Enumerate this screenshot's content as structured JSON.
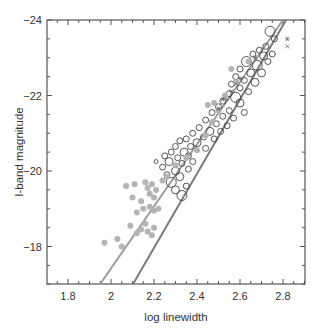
{
  "chart_data": {
    "type": "scatter",
    "title": "",
    "xlabel": "log linewidth",
    "ylabel": "I-band magnitude",
    "xlim": [
      1.7,
      2.9
    ],
    "ylim": [
      -17.0,
      -24.0
    ],
    "y_inverted": true,
    "x_ticks": [
      1.8,
      2.0,
      2.2,
      2.4,
      2.6,
      2.8
    ],
    "x_tick_labels": [
      "1.8",
      "2",
      "2.2",
      "2.4",
      "2.6",
      "2.8"
    ],
    "y_ticks": [
      -24,
      -22,
      -20,
      -18
    ],
    "y_tick_labels": [
      "-24",
      "-22",
      "-20",
      "-18"
    ],
    "grid": false,
    "legend": null,
    "lines": [
      {
        "name": "fit-left",
        "color": "#9a9a9a",
        "x": [
          1.949,
          2.8
        ],
        "y": [
          -17.0,
          -24.0
        ]
      },
      {
        "name": "fit-right",
        "color": "#7a7a7a",
        "x": [
          2.102,
          2.814
        ],
        "y": [
          -17.0,
          -24.0
        ]
      }
    ],
    "series": [
      {
        "name": "open circles",
        "marker": "open-circle",
        "color": "#444444",
        "points": [
          [
            2.74,
            -23.7,
            5
          ],
          [
            2.76,
            -23.5,
            3
          ],
          [
            2.72,
            -23.3,
            3
          ],
          [
            2.69,
            -23.2,
            3
          ],
          [
            2.66,
            -23.1,
            3
          ],
          [
            2.71,
            -23.05,
            4
          ],
          [
            2.75,
            -23.1,
            3
          ],
          [
            2.63,
            -22.9,
            5
          ],
          [
            2.68,
            -22.8,
            5
          ],
          [
            2.73,
            -22.9,
            3
          ],
          [
            2.6,
            -22.7,
            3
          ],
          [
            2.65,
            -22.6,
            4
          ],
          [
            2.7,
            -22.6,
            4
          ],
          [
            2.58,
            -22.5,
            3
          ],
          [
            2.62,
            -22.4,
            3
          ],
          [
            2.67,
            -22.35,
            4
          ],
          [
            2.56,
            -22.3,
            3
          ],
          [
            2.6,
            -22.2,
            3
          ],
          [
            2.64,
            -22.1,
            3
          ],
          [
            2.55,
            -22.05,
            3
          ],
          [
            2.58,
            -21.95,
            5
          ],
          [
            2.52,
            -21.85,
            3
          ],
          [
            2.6,
            -21.8,
            4
          ],
          [
            2.5,
            -21.7,
            3
          ],
          [
            2.55,
            -21.6,
            3
          ],
          [
            2.62,
            -21.55,
            3
          ],
          [
            2.47,
            -21.55,
            3
          ],
          [
            2.52,
            -21.45,
            3
          ],
          [
            2.57,
            -21.4,
            3
          ],
          [
            2.44,
            -21.35,
            3
          ],
          [
            2.49,
            -21.25,
            3
          ],
          [
            2.54,
            -21.2,
            3
          ],
          [
            2.41,
            -21.15,
            3
          ],
          [
            2.46,
            -21.05,
            4
          ],
          [
            2.51,
            -21.05,
            3
          ],
          [
            2.38,
            -21.0,
            3
          ],
          [
            2.43,
            -20.9,
            3
          ],
          [
            2.48,
            -20.85,
            3
          ],
          [
            2.35,
            -20.85,
            3
          ],
          [
            2.4,
            -20.75,
            4
          ],
          [
            2.32,
            -20.8,
            3
          ],
          [
            2.37,
            -20.65,
            3
          ],
          [
            2.44,
            -20.6,
            3
          ],
          [
            2.3,
            -20.65,
            3
          ],
          [
            2.34,
            -20.5,
            4
          ],
          [
            2.28,
            -20.5,
            3
          ],
          [
            2.25,
            -20.4,
            3
          ],
          [
            2.31,
            -20.35,
            3
          ],
          [
            2.36,
            -20.4,
            3
          ],
          [
            2.27,
            -20.25,
            4
          ],
          [
            2.33,
            -20.2,
            3
          ],
          [
            2.38,
            -20.25,
            3
          ],
          [
            2.24,
            -20.1,
            3
          ],
          [
            2.3,
            -20.0,
            4
          ],
          [
            2.36,
            -20.05,
            3
          ],
          [
            2.21,
            -20.25,
            2
          ],
          [
            2.26,
            -19.9,
            3
          ],
          [
            2.32,
            -19.85,
            4
          ],
          [
            2.28,
            -19.7,
            5
          ],
          [
            2.35,
            -19.6,
            3
          ],
          [
            2.3,
            -19.5,
            4
          ],
          [
            2.33,
            -19.35,
            5
          ]
        ]
      },
      {
        "name": "filled grey circles",
        "marker": "filled-circle",
        "color": "#b4b4b4",
        "points": [
          [
            1.97,
            -18.1
          ],
          [
            2.03,
            -18.2
          ],
          [
            2.05,
            -18.0
          ],
          [
            2.09,
            -18.55
          ],
          [
            2.12,
            -18.35
          ],
          [
            2.14,
            -18.45
          ],
          [
            2.17,
            -18.4
          ],
          [
            2.19,
            -18.3
          ],
          [
            2.16,
            -18.6
          ],
          [
            2.2,
            -18.5
          ],
          [
            2.12,
            -18.9
          ],
          [
            2.15,
            -19.0
          ],
          [
            2.18,
            -19.05
          ],
          [
            2.2,
            -18.95
          ],
          [
            2.22,
            -19.0
          ],
          [
            2.1,
            -19.3
          ],
          [
            2.14,
            -19.2
          ],
          [
            2.18,
            -19.4
          ],
          [
            2.2,
            -19.3
          ],
          [
            2.17,
            -19.55
          ],
          [
            2.21,
            -19.5
          ],
          [
            2.16,
            -19.7
          ],
          [
            2.19,
            -19.65
          ],
          [
            2.11,
            -19.65
          ],
          [
            2.07,
            -19.6
          ],
          [
            2.24,
            -19.75
          ],
          [
            2.26,
            -19.85
          ],
          [
            2.3,
            -20.15
          ],
          [
            2.35,
            -20.35
          ],
          [
            2.4,
            -20.55
          ],
          [
            2.44,
            -20.95
          ],
          [
            2.47,
            -21.3
          ],
          [
            2.5,
            -21.6
          ],
          [
            2.45,
            -21.75
          ],
          [
            2.48,
            -21.8
          ],
          [
            2.53,
            -22.0
          ],
          [
            2.58,
            -22.35
          ],
          [
            2.56,
            -22.7
          ],
          [
            2.64,
            -22.9
          ]
        ]
      },
      {
        "name": "asterisks",
        "marker": "asterisk",
        "color": "#666666",
        "points": [
          [
            2.5,
            -21.65
          ],
          [
            2.52,
            -21.9
          ],
          [
            2.56,
            -22.1
          ],
          [
            2.6,
            -22.45
          ],
          [
            2.82,
            -23.5
          ],
          [
            2.67,
            -23.0
          ]
        ]
      },
      {
        "name": "crosses",
        "marker": "cross",
        "color": "#666666",
        "points": [
          [
            2.82,
            -23.3
          ],
          [
            2.58,
            -22.3
          ],
          [
            2.54,
            -21.9
          ]
        ]
      }
    ]
  },
  "axes": {
    "xlabel": "log linewidth",
    "ylabel": "I-band magnitude",
    "colors": {
      "axis": "#555555",
      "text": "#333333"
    }
  }
}
